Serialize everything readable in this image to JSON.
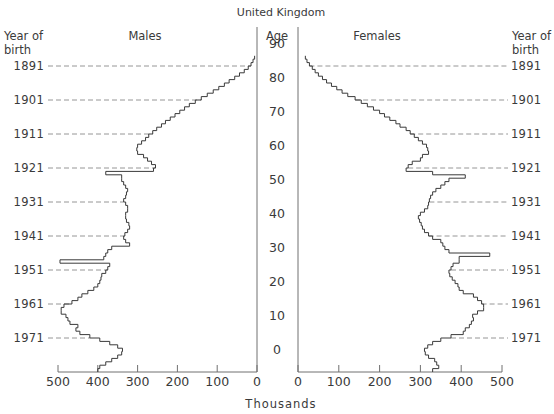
{
  "chart_data": {
    "type": "population-pyramid",
    "title": "United Kingdom",
    "xlabel": "Thousands",
    "ylabel": "Age",
    "left_panel_label": "Males",
    "right_panel_label": "Females",
    "year_of_birth_label_line1": "Year of",
    "year_of_birth_label_line2": "birth",
    "age_ticks": [
      "90",
      "80",
      "70",
      "60",
      "50",
      "40",
      "30",
      "20",
      "10",
      "0"
    ],
    "male_x_ticks": [
      "500",
      "400",
      "300",
      "200",
      "100",
      "0"
    ],
    "female_x_ticks": [
      "0",
      "100",
      "200",
      "300",
      "400",
      "500"
    ],
    "xlim": [
      0,
      500
    ],
    "age_range": [
      -4,
      92
    ],
    "year_of_birth_markers": [
      {
        "year": "1891",
        "age": 86
      },
      {
        "year": "1901",
        "age": 76
      },
      {
        "year": "1911",
        "age": 66
      },
      {
        "year": "1921",
        "age": 56
      },
      {
        "year": "1931",
        "age": 46
      },
      {
        "year": "1941",
        "age": 36
      },
      {
        "year": "1951",
        "age": 26
      },
      {
        "year": "1961",
        "age": 16
      },
      {
        "year": "1971",
        "age": 6
      }
    ],
    "series": [
      {
        "name": "Males",
        "start_age": -4,
        "values": [
          400,
          395,
          380,
          365,
          350,
          340,
          338,
          350,
          370,
          395,
          420,
          445,
          455,
          450,
          470,
          475,
          480,
          492,
          492,
          485,
          465,
          450,
          440,
          425,
          410,
          400,
          395,
          392,
          390,
          380,
          375,
          370,
          495,
          385,
          380,
          375,
          365,
          320,
          330,
          335,
          332,
          325,
          320,
          322,
          328,
          330,
          330,
          325,
          325,
          330,
          335,
          330,
          328,
          325,
          330,
          335,
          340,
          340,
          380,
          260,
          255,
          265,
          275,
          285,
          300,
          302,
          300,
          290,
          280,
          272,
          262,
          252,
          240,
          230,
          218,
          206,
          194,
          182,
          170,
          155,
          140,
          125,
          110,
          96,
          82,
          70,
          56,
          44,
          32,
          22,
          15,
          10,
          6
        ]
      },
      {
        "name": "Females",
        "start_age": -4,
        "values": [
          330,
          345,
          340,
          335,
          320,
          312,
          310,
          318,
          330,
          350,
          375,
          405,
          410,
          420,
          425,
          430,
          428,
          440,
          455,
          455,
          450,
          440,
          430,
          405,
          395,
          392,
          385,
          378,
          372,
          370,
          375,
          380,
          395,
          395,
          470,
          370,
          360,
          355,
          350,
          330,
          320,
          310,
          305,
          302,
          298,
          295,
          300,
          310,
          318,
          320,
          322,
          325,
          330,
          338,
          350,
          360,
          370,
          410,
          330,
          265,
          270,
          280,
          300,
          305,
          320,
          318,
          315,
          305,
          295,
          285,
          275,
          265,
          250,
          240,
          225,
          212,
          200,
          185,
          170,
          155,
          140,
          122,
          108,
          95,
          82,
          70,
          60,
          50,
          42,
          35,
          28,
          22,
          18
        ]
      }
    ]
  }
}
